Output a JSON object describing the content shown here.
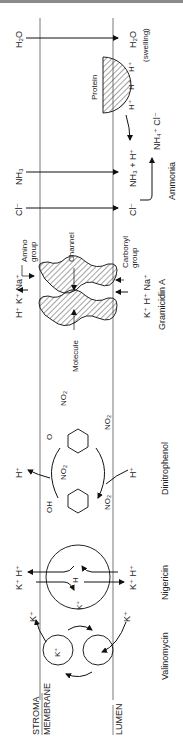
{
  "diagram": {
    "orientation": "rotated-90-ccw",
    "regions": {
      "stroma": "STROMA",
      "membrane": "MEMBRANE",
      "lumen": "LUMEN"
    },
    "sections": {
      "valinomycin": {
        "name": "Valinomycin",
        "ion_top": "K⁺",
        "ion_bottom": "K⁺",
        "complex_label": "K⁺"
      },
      "nigericin": {
        "name": "Nigericin",
        "top_ions": "K⁺ H⁺",
        "bottom_ions": "K⁺ H⁺",
        "inner_h": "H",
        "inner_k": "K⁺"
      },
      "dinitrophenol": {
        "name": "Dinitrophenol",
        "h_top": "H⁺",
        "h_bottom": "H⁺",
        "oh": "OH",
        "o": "O",
        "no2": "NO₂"
      },
      "gramicidin": {
        "name": "Gramicidin A",
        "top_ions": "H⁺ K⁺ Na⁺",
        "bottom_ions": "K⁺ H⁺ Na⁺",
        "amino_group": [
          "Amino",
          "group"
        ],
        "carbonyl_group": [
          "Carbonyl",
          "group"
        ],
        "channel": "Channel",
        "molecule": "Molecule"
      },
      "ammonia": {
        "name": "Ammonia",
        "cl_top": "Cl⁻",
        "cl_bottom": "Cl⁻",
        "nh3_top": "NH₃",
        "nh3_bottom": "NH₃ + H⁺",
        "nh4cl": "NH₄⁺ Cl⁻",
        "protein": "Protein",
        "protons": [
          "H⁺",
          "H⁺",
          "H⁺"
        ]
      },
      "water": {
        "top": "H₂O",
        "bottom": "H₂O",
        "note": "(swelling)"
      }
    },
    "colors": {
      "line": "#222222",
      "membrane_line": "#555555",
      "border": "#8a8a8a",
      "hatch": "#333333"
    }
  }
}
